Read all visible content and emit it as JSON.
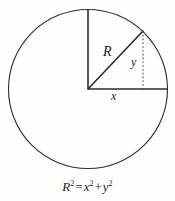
{
  "figure": {
    "type": "geometry-diagram",
    "background_color": "#fefefe",
    "stroke_color": "#2b2b2b",
    "label_color": "#1b1b1b"
  },
  "circle": {
    "name": "circle-outline",
    "center_x": 88,
    "center_y": 89,
    "radius": 79.5,
    "stroke_width": 1.1
  },
  "segments": {
    "vertical_radius": {
      "name": "vertical-radius",
      "x1": 88,
      "y1": 9.5,
      "x2": 88,
      "y2": 89,
      "style": "solid",
      "stroke_width": 1.6
    },
    "horizontal_radius": {
      "name": "horizontal-radius",
      "x1": 88,
      "y1": 89,
      "x2": 167.5,
      "y2": 89,
      "style": "solid",
      "stroke_width": 1.6
    },
    "hypotenuse_radius": {
      "name": "slanted-radius-R",
      "x1": 88,
      "y1": 89,
      "x2": 143,
      "y2": 31,
      "style": "solid",
      "stroke_width": 1.6
    },
    "dropped_perpendicular": {
      "name": "dotted-vertical-y",
      "x1": 143,
      "y1": 31,
      "x2": 143,
      "y2": 89,
      "style": "dotted",
      "stroke_width": 1.1,
      "dash_pattern": "1.6 2.2"
    }
  },
  "labels": {
    "radius": "R",
    "vertical_leg": "y",
    "horizontal_leg": "x"
  },
  "equation": {
    "left_base": "R",
    "left_exponent": "2",
    "equals": "=",
    "term1_base": "x",
    "term1_exponent": "2",
    "plus": "+",
    "term2_base": "y",
    "term2_exponent": "2"
  }
}
